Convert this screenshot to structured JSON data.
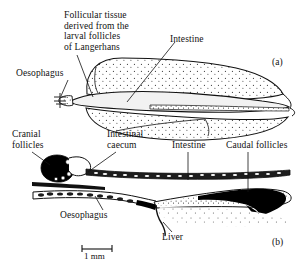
{
  "figure": {
    "caption_panels": {
      "a": "(a)",
      "b": "(b)"
    },
    "scale_bar": {
      "label": "1 mm"
    },
    "panel_a": {
      "labels": {
        "follicular_tissue": "Follicular tissue\nderived from the\nlarval follicles\nof Langerhans",
        "intestine": "Intestine",
        "oesophagus": "Oesophagus"
      }
    },
    "panel_b": {
      "labels": {
        "cranial_follicles": "Cranial\nfollicles",
        "intestinal_caecum": "Intestinal\ncaecum",
        "intestine": "Intestine",
        "caudal_follicles": "Caudal follicles",
        "oesophagus": "Oesophagus",
        "liver": "Liver"
      }
    },
    "colors": {
      "ink": "#111111",
      "background": "#ffffff",
      "stipple": "#3a3a3a",
      "solid_fill": "#000000"
    }
  }
}
